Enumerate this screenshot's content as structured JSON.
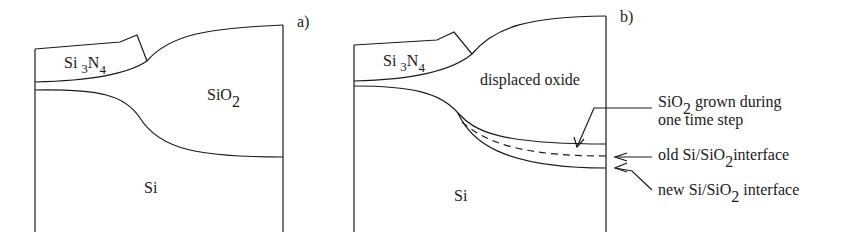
{
  "panel_a": {
    "label": "a)",
    "nitride": {
      "base": "Si",
      "sub1": "3",
      "mid": "N",
      "sub2": "4"
    },
    "oxide": {
      "base": "SiO",
      "sub": "2"
    },
    "silicon": "Si"
  },
  "panel_b": {
    "label": "b)",
    "nitride": {
      "base": "Si",
      "sub1": "3",
      "mid": "N",
      "sub2": "4"
    },
    "oxide": "displaced oxide",
    "silicon": "Si",
    "annotations": {
      "grown": {
        "base": "SiO",
        "sub": "2",
        "rest": " grown during",
        "line2": "one time step"
      },
      "old_interface": {
        "pre": "old Si/SiO",
        "sub": "2",
        "post": "interface"
      },
      "new_interface": {
        "pre": "new Si/SiO",
        "sub": "2",
        "post": " interface"
      }
    }
  }
}
